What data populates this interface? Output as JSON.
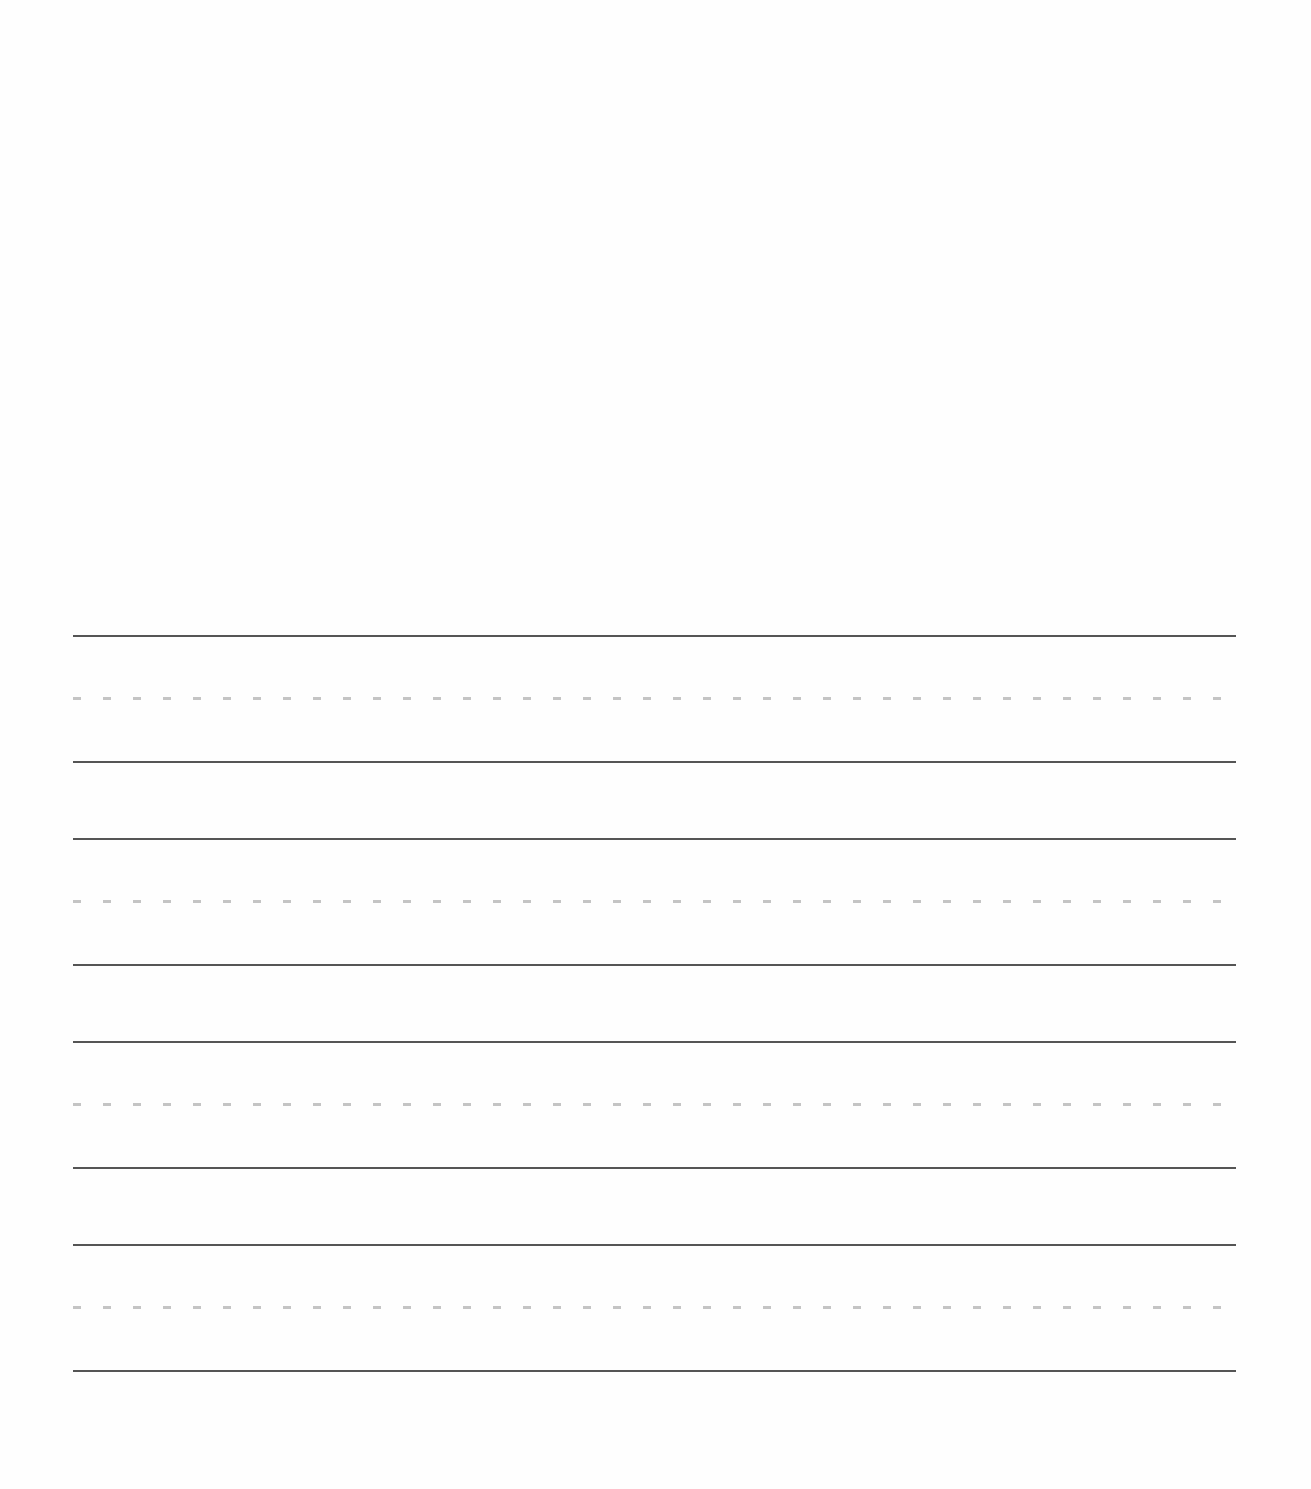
{
  "page": {
    "type": "handwriting-practice-sheet",
    "background_color": "#fefefe",
    "content_text": ""
  },
  "colors": {
    "solid_line": "#555555",
    "dashed_midline": "#c4c4c4"
  },
  "line_sets": [
    {
      "index": 1,
      "top_y": 635,
      "midline_y": 698,
      "baseline_y": 762
    },
    {
      "index": 2,
      "top_y": 838,
      "midline_y": 902,
      "baseline_y": 965
    },
    {
      "index": 3,
      "top_y": 1041,
      "midline_y": 1104,
      "baseline_y": 1168
    },
    {
      "index": 4,
      "top_y": 1244,
      "midline_y": 1307,
      "baseline_y": 1370
    }
  ]
}
